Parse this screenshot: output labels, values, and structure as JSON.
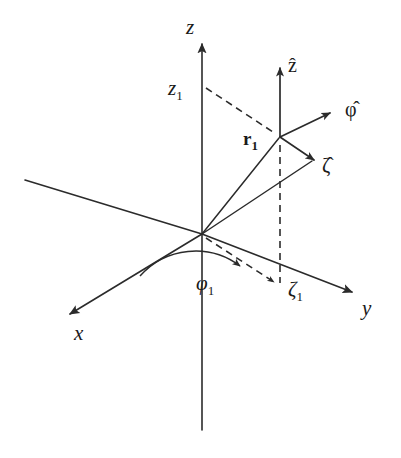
{
  "figure": {
    "name": "cylindrical-coordinate-system-diagram",
    "background_color": "#ffffff",
    "ink_color": "#2b2b2b",
    "width": 401,
    "height": 458
  },
  "axes": [
    {
      "id": "z-axis",
      "label": "z",
      "description": "vertical axis with upward arrowhead"
    },
    {
      "id": "x-axis",
      "label": "x",
      "description": "axis directed toward lower left with arrowhead"
    },
    {
      "id": "y-axis",
      "label": "y",
      "description": "axis directed toward lower right with arrowhead"
    }
  ],
  "points": [
    {
      "id": "origin",
      "label": ""
    },
    {
      "id": "field-point",
      "label": "r",
      "subscript": "1",
      "bold": true,
      "description": "position vector r-sub-1 to the field point"
    }
  ],
  "coordinates": [
    {
      "id": "z-coordinate",
      "label": "z",
      "subscript": "1",
      "description": "height of the field point marked on the z axis"
    },
    {
      "id": "phi-coordinate",
      "label": "φ",
      "subscript": "1",
      "description": "azimuthal angle measured in the x-y plane"
    },
    {
      "id": "zeta-coordinate",
      "label": "ζ",
      "subscript": "1",
      "description": "radial cylindrical coordinate in the x-y plane"
    }
  ],
  "unit_vectors": [
    {
      "id": "z-hat",
      "base": "z",
      "accent": "̂",
      "label": "ẑ",
      "description": "unit vector along z at the field point, pointing up"
    },
    {
      "id": "phi-hat",
      "base": "φ",
      "accent": "̂",
      "label": "φ̂",
      "description": "azimuthal unit vector at the field point, pointing upper right"
    },
    {
      "id": "zeta-hat",
      "base": "ζ",
      "accent": "̂",
      "label": "ζ̂",
      "description": "radial unit vector at the field point, pointing lower right"
    }
  ]
}
